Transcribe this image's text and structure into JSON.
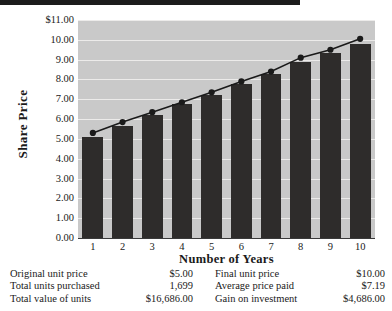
{
  "chart_data": {
    "type": "bar",
    "title": "",
    "subtitle": "",
    "xlabel": "Number of Years",
    "ylabel": "Share Price",
    "categories": [
      "1",
      "2",
      "3",
      "4",
      "5",
      "6",
      "7",
      "8",
      "9",
      "10"
    ],
    "x": [
      1,
      2,
      3,
      4,
      5,
      6,
      7,
      8,
      9,
      10
    ],
    "ylim": [
      0.0,
      11.0
    ],
    "ytick_labels": [
      "$11.00",
      "10.00",
      "9.00",
      "8.00",
      "7.00",
      "6.00",
      "5.00",
      "4.00",
      "3.00",
      "2.00",
      "1.00",
      "0.00"
    ],
    "ytick_values": [
      11.0,
      10.0,
      9.0,
      8.0,
      7.0,
      6.0,
      5.0,
      4.0,
      3.0,
      2.0,
      1.0,
      0.0
    ],
    "grid": true,
    "legend": "none",
    "series": [
      {
        "name": "Share Price (bars)",
        "type": "bar",
        "color": "#2e2c2b",
        "values": [
          5.1,
          5.65,
          6.2,
          6.75,
          7.2,
          7.75,
          8.3,
          8.9,
          9.35,
          9.8
        ]
      },
      {
        "name": "Share Price (trend)",
        "type": "line",
        "color": "#1a1a1a",
        "marker": "circle",
        "values": [
          5.3,
          5.85,
          6.35,
          6.85,
          7.35,
          7.9,
          8.4,
          9.1,
          9.5,
          10.05
        ]
      }
    ]
  },
  "axes": {
    "y_title": "Share Price",
    "x_title": "Number of Years"
  },
  "summary": {
    "rows": [
      {
        "left_label": "Original unit price",
        "left_value": "$5.00",
        "right_label": "Final unit price",
        "right_value": "$10.00"
      },
      {
        "left_label": "Total units purchased",
        "left_value": "1,699",
        "right_label": "Average price paid",
        "right_value": "$7.19"
      },
      {
        "left_label": "Total value of units",
        "left_value": "$16,686.00",
        "right_label": "Gain on investment",
        "right_value": "$4,686.00"
      }
    ]
  },
  "colors": {
    "bar": "#2e2c2b",
    "plot_background": "#c9c9c9",
    "gridline": "#ecebea",
    "line": "#1a1a1a",
    "text": "#1a1a1a"
  }
}
